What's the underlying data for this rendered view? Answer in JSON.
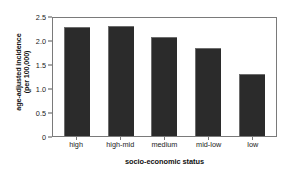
{
  "chart_data": {
    "type": "bar",
    "title": "",
    "subtitle": "",
    "xlabel": "socio-economic status",
    "ylabel_lines": [
      "age-adjusted incidence",
      "(per 100,000)"
    ],
    "ylabel": "age-adjusted incidence (per 100,000)",
    "categories": [
      "high",
      "high-mid",
      "medium",
      "mid-low",
      "low"
    ],
    "values": [
      2.27,
      2.3,
      2.06,
      1.83,
      1.3
    ],
    "ylim": [
      0,
      2.5
    ],
    "yticks": [
      0,
      0.5,
      1.0,
      1.5,
      2.0,
      2.5
    ],
    "ytick_labels": [
      "0",
      "0.5",
      "1.0",
      "1.5",
      "2.0",
      "2.5"
    ],
    "grid": false,
    "legend": null,
    "bar_color": "#2b2b2b",
    "axis_color": "#7a7a7a",
    "background_color": "#ffffff"
  }
}
